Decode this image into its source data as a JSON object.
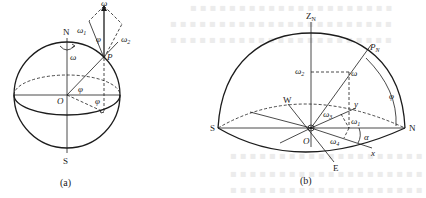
{
  "figure_a": {
    "caption": "(a)",
    "labels": {
      "north": "N",
      "south": "S",
      "origin": "O",
      "point": "P",
      "omega": "ω",
      "omega_rotation": "ω",
      "omega1": "ω",
      "omega1_sub": "1",
      "omega2": "ω",
      "omega2_sub": "2",
      "phi_top": "φ",
      "phi_center": "φ",
      "phi_bottom": "φ"
    }
  },
  "figure_b": {
    "caption": "(b)",
    "labels": {
      "zenith": "Z",
      "zenith_sub": "N",
      "pole": "P",
      "pole_sub": "N",
      "omega": "ω",
      "omega1": "ω",
      "omega1_sub": "1",
      "omega2": "ω",
      "omega2_sub": "2",
      "omega3": "ω",
      "omega3_sub": "3",
      "omega4": "ω",
      "omega4_sub": "4",
      "phi": "φ",
      "alpha": "α",
      "west": "W",
      "east": "E",
      "south": "S",
      "north": "N",
      "origin": "O",
      "axis_x": "x",
      "axis_y": "y"
    }
  },
  "colors": {
    "line": "#1c1c1c",
    "background": "#ffffff",
    "ghost_text": "#ececec"
  }
}
